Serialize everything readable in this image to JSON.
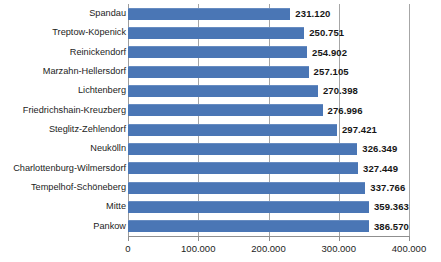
{
  "chart_data": {
    "type": "bar",
    "orientation": "horizontal",
    "title": "",
    "subtitle": "",
    "xlabel": "",
    "ylabel": "",
    "xlim": [
      0,
      400000
    ],
    "grid": true,
    "legend": null,
    "legend_position": "none",
    "bar_color": "#4a76b5",
    "axis_color": "#a6a6a6",
    "label_color": "#161616",
    "tick_labels": [
      "0",
      "100.000",
      "200.000",
      "300.000",
      "400.000"
    ],
    "tick_values": [
      0,
      100000,
      200000,
      300000,
      400000
    ],
    "categories": [
      "Spandau",
      "Treptow-Köpenick",
      "Reinickendorf",
      "Marzahn-Hellersdorf",
      "Lichtenberg",
      "Friedrichshain-Kreuzberg",
      "Steglitz-Zehlendorf",
      "Neukölln",
      "Charlottenburg-Wilmersdorf",
      "Tempelhof-Schöneberg",
      "Mitte",
      "Pankow"
    ],
    "values": [
      231120,
      250751,
      254902,
      257105,
      270398,
      276996,
      297421,
      326349,
      327449,
      337766,
      359363,
      386570
    ],
    "value_labels": [
      "231.120",
      "250.751",
      "254.902",
      "257.105",
      "270.398",
      "276.996",
      "297.421",
      "326.349",
      "327.449",
      "337.766",
      "359.363",
      "386.570"
    ]
  }
}
